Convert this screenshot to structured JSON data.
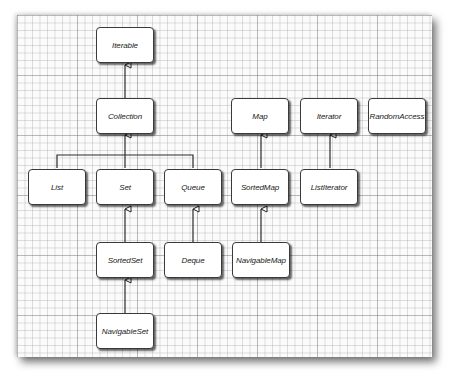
{
  "diagram": {
    "type": "interface-inheritance",
    "nodes": {
      "iterable": {
        "label": "Iterable"
      },
      "collection": {
        "label": "Collection"
      },
      "list": {
        "label": "List"
      },
      "set": {
        "label": "Set"
      },
      "queue": {
        "label": "Queue"
      },
      "sorted_set": {
        "label": "SortedSet"
      },
      "deque": {
        "label": "Deque"
      },
      "navigable_set": {
        "label": "NavigableSet"
      },
      "map": {
        "label": "Map"
      },
      "sorted_map": {
        "label": "SortedMap"
      },
      "navigable_map": {
        "label": "NavigableMap"
      },
      "iterator": {
        "label": "Iterator"
      },
      "list_iterator": {
        "label": "ListIterator"
      },
      "random_access": {
        "label": "RandomAccess"
      }
    },
    "edges": [
      {
        "from": "Collection",
        "to": "Iterable"
      },
      {
        "from": "List",
        "to": "Collection"
      },
      {
        "from": "Set",
        "to": "Collection"
      },
      {
        "from": "Queue",
        "to": "Collection"
      },
      {
        "from": "SortedSet",
        "to": "Set"
      },
      {
        "from": "NavigableSet",
        "to": "SortedSet"
      },
      {
        "from": "Deque",
        "to": "Queue"
      },
      {
        "from": "SortedMap",
        "to": "Map"
      },
      {
        "from": "NavigableMap",
        "to": "SortedMap"
      },
      {
        "from": "ListIterator",
        "to": "Iterator"
      }
    ]
  }
}
